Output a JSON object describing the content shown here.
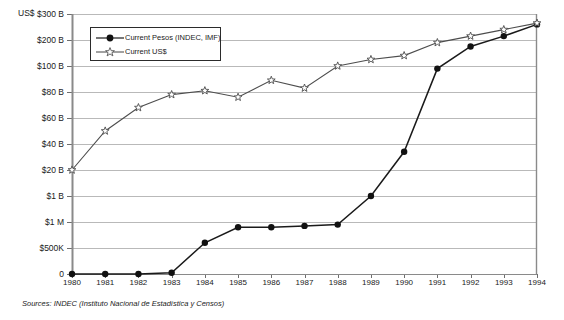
{
  "chart_data": {
    "type": "line",
    "title": "",
    "xlabel": "",
    "ylabel": "US$",
    "axis_unit_label": "US$",
    "categories": [
      1980,
      1981,
      1982,
      1983,
      1984,
      1985,
      1986,
      1987,
      1988,
      1989,
      1990,
      1991,
      1992,
      1993,
      1994
    ],
    "xtick_labels": [
      "1980",
      "1981",
      "1982",
      "1983",
      "1984",
      "1985",
      "1986",
      "1987",
      "1988",
      "1989",
      "1990",
      "1991",
      "1992",
      "1993",
      "1994"
    ],
    "ytick_labels": [
      "$300 B",
      "$200 B",
      "$100 B",
      "$80 B",
      "$60 B",
      "$40 B",
      "$20 B",
      "$1 B",
      "$1 M",
      "$500K",
      "0"
    ],
    "ytick_values": [
      300000000000,
      200000000000,
      100000000000,
      80000000000,
      60000000000,
      40000000000,
      20000000000,
      1000000000,
      1000000,
      500000,
      0
    ],
    "y_axis_scale": "non-linear (custom ordinal tick spacing)",
    "grid": true,
    "legend_position": "top-left inside plot",
    "series": [
      {
        "name": "Current Pesos (INDEC, IMF)",
        "marker": "filled-circle",
        "color": "#1a1a1a",
        "values_tick_index": [
          10,
          10,
          10,
          9.95,
          8.8,
          8.2,
          8.2,
          8.15,
          8.1,
          7.0,
          5.3,
          2.1,
          1.25,
          0.85,
          0.4
        ],
        "values_label": [
          "0",
          "0",
          "0",
          "~0",
          "between $500K and $1 M",
          "~$1 M",
          "~$1 M",
          "~$1 M",
          "~$1 M",
          "~$1 B",
          "~$40 B",
          "~$170 B",
          "~$230 B",
          "~$255 B",
          "~$275 B"
        ]
      },
      {
        "name": "Current US$",
        "marker": "open-star",
        "color": "#4d4d4d",
        "values_tick_index": [
          6.0,
          4.5,
          3.6,
          3.1,
          2.95,
          3.2,
          2.55,
          2.85,
          2.0,
          1.75,
          1.6,
          1.1,
          0.85,
          0.6,
          0.35
        ],
        "values_label": [
          "$20 B",
          "~$50 B",
          "~$65 B",
          "~$76 B",
          "~$80 B",
          "~$75 B",
          "~$91 B",
          "~$85 B",
          "~$110 B",
          "~$118 B",
          "~$122 B",
          "~$180 B",
          "~$230 B",
          "~$255 B",
          "~$278 B"
        ]
      }
    ],
    "source_note": "Sources: INDEC (Instituto Nacional de Estadística y Censos)"
  },
  "legend": {
    "items": [
      {
        "label": "Current Pesos (INDEC, IMF)",
        "marker": "filled-circle"
      },
      {
        "label": "Current US$",
        "marker": "open-star"
      }
    ]
  },
  "colors": {
    "background": "#ffffff",
    "axis": "#6e6e6e",
    "grid": "#b9b9b9",
    "series_pesos": "#1a1a1a",
    "series_usd": "#555555",
    "text": "#1a1a1a"
  }
}
